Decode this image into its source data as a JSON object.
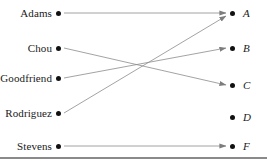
{
  "figure": {
    "width": 267,
    "height": 162,
    "background_color": "#ffffff",
    "line_color": "#8c8c8c",
    "dot_color": "#111111",
    "text_color": "#1a1a1a",
    "baseline_color": "#8a8a8a"
  },
  "domain": {
    "label": "",
    "dot_x": 58,
    "items": [
      {
        "id": "adams",
        "label": "Adams",
        "y": 13
      },
      {
        "id": "chou",
        "label": "Chou",
        "y": 48
      },
      {
        "id": "goodfriend",
        "label": "Goodfriend",
        "y": 78
      },
      {
        "id": "rodriguez",
        "label": "Rodriguez",
        "y": 113
      },
      {
        "id": "stevens",
        "label": "Stevens",
        "y": 146
      }
    ]
  },
  "codomain": {
    "label": "",
    "dot_x": 232,
    "items": [
      {
        "id": "A",
        "label": "A",
        "y": 13
      },
      {
        "id": "B",
        "label": "B",
        "y": 48
      },
      {
        "id": "C",
        "label": "C",
        "y": 85
      },
      {
        "id": "D",
        "label": "D",
        "y": 117
      },
      {
        "id": "F",
        "label": "F",
        "y": 146
      }
    ]
  },
  "mappings": [
    {
      "from": "adams",
      "to": "A",
      "x1": 64,
      "y1": 13,
      "x2": 226,
      "y2": 13
    },
    {
      "from": "chou",
      "to": "C",
      "x1": 64,
      "y1": 48,
      "x2": 226,
      "y2": 85
    },
    {
      "from": "goodfriend",
      "to": "B",
      "x1": 64,
      "y1": 78,
      "x2": 226,
      "y2": 48
    },
    {
      "from": "rodriguez",
      "to": "A",
      "x1": 64,
      "y1": 113,
      "x2": 226,
      "y2": 16
    },
    {
      "from": "stevens",
      "to": "F",
      "x1": 64,
      "y1": 146,
      "x2": 226,
      "y2": 146
    }
  ],
  "unmapped_codomain_items": [
    "D"
  ],
  "crossing_point": {
    "x": 157,
    "y": 65
  }
}
